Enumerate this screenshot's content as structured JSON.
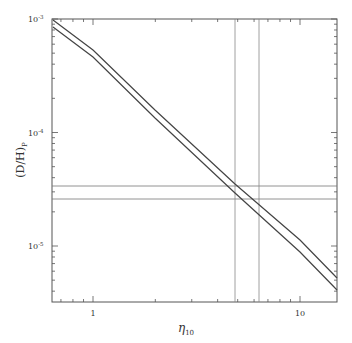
{
  "chart_data": {
    "type": "line",
    "title": "",
    "xlabel": "η₁₀",
    "ylabel": "(D/H)P",
    "xscale": "log",
    "yscale": "log",
    "xlim": [
      0.65,
      15
    ],
    "ylim": [
      3e-06,
      0.001
    ],
    "x_tick_labels": [
      "1",
      "10"
    ],
    "y_tick_labels": [
      "10⁻³",
      "10⁻⁴",
      "10⁻⁵"
    ],
    "grid": false,
    "series": [
      {
        "name": "upper bound",
        "x": [
          0.65,
          1,
          2,
          5,
          10,
          15
        ],
        "y": [
          0.001,
          0.00055,
          0.00016,
          3.7e-05,
          1.3e-05,
          6e-06
        ]
      },
      {
        "name": "lower bound",
        "x": [
          0.65,
          1,
          2,
          5,
          10,
          15
        ],
        "y": [
          0.00086,
          0.00047,
          0.000135,
          3.1e-05,
          1.1e-05,
          4.6e-06
        ]
      }
    ],
    "reference_lines": {
      "horizontal": [
        3.4e-05,
        2.6e-05
      ],
      "vertical": [
        4.9,
        6.3
      ]
    }
  },
  "axes": {
    "xlabel_main": "η",
    "xlabel_sub": "10",
    "ylabel_main": "(D/H)",
    "ylabel_sub": "P",
    "ytick": [
      "10",
      "-3",
      "10",
      "-4",
      "10",
      "-5"
    ],
    "xtick": [
      "1",
      "10"
    ]
  }
}
